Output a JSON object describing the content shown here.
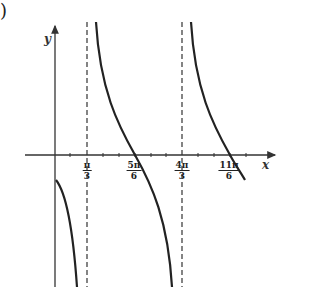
{
  "corner_mark": ")",
  "axes": {
    "x_label": "x",
    "y_label": "y"
  },
  "ticks": [
    {
      "num": "π",
      "den": "3"
    },
    {
      "num": "5π",
      "den": "6"
    },
    {
      "num": "4π",
      "den": "3"
    },
    {
      "num": "11π",
      "den": "6"
    }
  ],
  "asymptotes": [
    "π/3",
    "4π/3"
  ],
  "zeros": [
    "5π/6",
    "11π/6"
  ],
  "colors": {
    "curve": "#222222",
    "axis": "#333333",
    "asymptote": "#333333"
  }
}
